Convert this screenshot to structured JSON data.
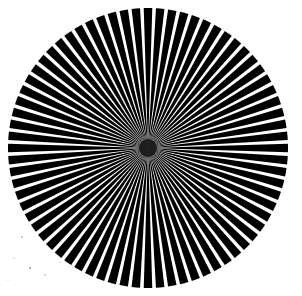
{
  "image": {
    "description": "Siemens star test pattern",
    "background": "#ffffff",
    "width": 302,
    "height": 296
  },
  "star": {
    "center_x": 148,
    "center_y": 148,
    "radius": 140,
    "spoke_count": 72,
    "black_fraction": 0.7,
    "spoke_color": "#000000",
    "gap_color": "#ffffff",
    "center_blur_color": "#111111"
  },
  "speckles": [
    {
      "x": 22,
      "y": 237,
      "r": 0.8
    },
    {
      "x": 30,
      "y": 268,
      "r": 1.1
    },
    {
      "x": 14,
      "y": 258,
      "r": 0.6
    },
    {
      "x": 45,
      "y": 275,
      "r": 0.7
    },
    {
      "x": 60,
      "y": 262,
      "r": 0.6
    },
    {
      "x": 8,
      "y": 280,
      "r": 0.6
    }
  ]
}
